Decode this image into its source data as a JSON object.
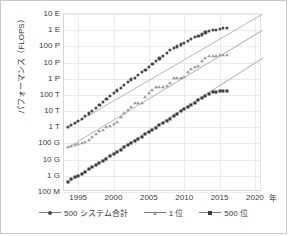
{
  "chart_data": {
    "type": "scatter",
    "title": "",
    "xlabel": "年",
    "ylabel": "パフォーマンス（FLOPS）",
    "xlim": [
      1993,
      2021
    ],
    "ylim_log10": [
      8,
      19
    ],
    "grid": true,
    "legend_position": "bottom",
    "xticks": [
      "1995",
      "2000",
      "2005",
      "2010",
      "2015",
      "2020"
    ],
    "xtick_values": [
      1995,
      2000,
      2005,
      2010,
      2015,
      2020
    ],
    "yticks": [
      "100 M",
      "1 G",
      "10 G",
      "100 G",
      "1 T",
      "10 T",
      "100 T",
      "1 P",
      "10 P",
      "100 P",
      "1 E",
      "10 E"
    ],
    "ytick_log10": [
      8,
      9,
      10,
      11,
      12,
      13,
      14,
      15,
      16,
      17,
      18,
      19
    ],
    "series": [
      {
        "name": "500 システム合計",
        "marker": "diamond",
        "color": "#4a4a4a",
        "x": [
          1993.5,
          1994.0,
          1994.5,
          1995.0,
          1995.5,
          1996.0,
          1996.5,
          1997.0,
          1997.5,
          1998.0,
          1998.5,
          1999.0,
          1999.5,
          2000.0,
          2000.5,
          2001.0,
          2001.5,
          2002.0,
          2002.5,
          2003.0,
          2003.5,
          2004.0,
          2004.5,
          2005.0,
          2005.5,
          2006.0,
          2006.5,
          2007.0,
          2007.5,
          2008.0,
          2008.5,
          2009.0,
          2009.5,
          2010.0,
          2010.5,
          2011.0,
          2011.5,
          2012.0,
          2012.5,
          2013.0,
          2013.5,
          2014.0,
          2014.5,
          2015.0,
          2015.5,
          2016.0
        ],
        "y_log10": [
          12.0,
          12.13,
          12.26,
          12.4,
          12.53,
          12.7,
          12.86,
          13.02,
          13.2,
          13.38,
          13.56,
          13.74,
          13.93,
          14.1,
          14.28,
          14.45,
          14.62,
          14.8,
          14.96,
          15.06,
          15.22,
          15.4,
          15.56,
          15.72,
          15.9,
          16.08,
          16.26,
          16.42,
          16.58,
          16.76,
          16.9,
          17.0,
          17.12,
          17.22,
          17.34,
          17.46,
          17.56,
          17.64,
          17.74,
          17.86,
          17.96,
          18.0,
          18.04,
          18.08,
          18.12,
          18.14
        ]
      },
      {
        "name": "1 位",
        "marker": "triangle",
        "color": "#9a9a9a",
        "x": [
          1993.5,
          1994.0,
          1994.5,
          1995.0,
          1995.5,
          1996.0,
          1996.5,
          1997.0,
          1997.5,
          1998.0,
          1998.5,
          1999.0,
          1999.5,
          2000.0,
          2000.5,
          2001.0,
          2001.5,
          2002.0,
          2002.5,
          2003.0,
          2003.5,
          2004.0,
          2004.5,
          2005.0,
          2005.5,
          2006.0,
          2006.5,
          2007.0,
          2007.5,
          2008.0,
          2008.5,
          2009.0,
          2009.5,
          2010.0,
          2010.5,
          2011.0,
          2011.5,
          2012.0,
          2012.5,
          2013.0,
          2013.5,
          2014.0,
          2014.5,
          2015.0,
          2015.5,
          2016.0
        ],
        "y_log10": [
          10.76,
          10.82,
          10.88,
          10.94,
          11.0,
          11.08,
          11.2,
          11.4,
          11.6,
          11.74,
          11.86,
          12.0,
          12.1,
          12.2,
          12.3,
          12.62,
          12.86,
          13.06,
          13.26,
          13.48,
          13.48,
          13.48,
          13.85,
          14.1,
          14.32,
          14.46,
          14.46,
          14.5,
          14.56,
          14.72,
          15.02,
          15.06,
          15.06,
          15.12,
          15.42,
          15.62,
          15.72,
          15.78,
          16.08,
          16.26,
          16.38,
          16.42,
          16.42,
          16.45,
          16.45,
          16.45
        ]
      },
      {
        "name": "500 位",
        "marker": "square",
        "color": "#3b3b3b",
        "x": [
          1993.5,
          1994.0,
          1994.5,
          1995.0,
          1995.5,
          1996.0,
          1996.5,
          1997.0,
          1997.5,
          1998.0,
          1998.5,
          1999.0,
          1999.5,
          2000.0,
          2000.5,
          2001.0,
          2001.5,
          2002.0,
          2002.5,
          2003.0,
          2003.5,
          2004.0,
          2004.5,
          2005.0,
          2005.5,
          2006.0,
          2006.5,
          2007.0,
          2007.5,
          2008.0,
          2008.5,
          2009.0,
          2009.5,
          2010.0,
          2010.5,
          2011.0,
          2011.5,
          2012.0,
          2012.5,
          2013.0,
          2013.5,
          2014.0,
          2014.5,
          2015.0,
          2015.5,
          2016.0
        ],
        "y_log10": [
          8.62,
          8.78,
          8.9,
          9.0,
          9.14,
          9.26,
          9.4,
          9.52,
          9.64,
          9.78,
          9.92,
          10.06,
          10.2,
          10.34,
          10.48,
          10.62,
          10.76,
          10.9,
          11.02,
          11.14,
          11.28,
          11.42,
          11.56,
          11.7,
          11.84,
          11.98,
          12.12,
          12.26,
          12.4,
          12.54,
          12.7,
          12.84,
          12.98,
          13.1,
          13.24,
          13.38,
          13.52,
          13.66,
          13.8,
          13.94,
          14.06,
          14.16,
          14.2,
          14.22,
          14.24,
          14.26
        ]
      }
    ],
    "trend_lines": [
      {
        "for": "500 システム合計",
        "x0": 1993.5,
        "y0_log10": 12.0,
        "x1": 2021.0,
        "y1_log10": 19.0
      },
      {
        "for": "1 位",
        "x0": 1993.5,
        "y0_log10": 10.76,
        "x1": 2021.0,
        "y1_log10": 18.0
      },
      {
        "for": "500 位",
        "x0": 1993.5,
        "y0_log10": 8.62,
        "x1": 2021.0,
        "y1_log10": 16.3
      }
    ]
  },
  "legend": {
    "items": [
      {
        "label": "500 システム合計",
        "marker": "diamond"
      },
      {
        "label": "1 位",
        "marker": "triangle"
      },
      {
        "label": "500 位",
        "marker": "square"
      }
    ]
  },
  "axis": {
    "x_unit": "年"
  }
}
